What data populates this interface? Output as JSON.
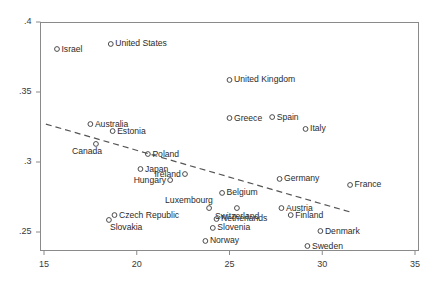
{
  "chart_data": {
    "type": "scatter",
    "title": "",
    "xlabel": "",
    "ylabel": "",
    "xlim": [
      15,
      35
    ],
    "ylim": [
      0.235,
      0.405
    ],
    "xticks": [
      15,
      20,
      25,
      30,
      35
    ],
    "xtick_labels": [
      "15",
      "20",
      "25",
      "30",
      "35"
    ],
    "yticks": [
      0.25,
      0.3,
      0.35,
      0.4
    ],
    "ytick_labels": [
      ".25",
      ".3",
      ".35",
      ".4"
    ],
    "grid": false,
    "legend": "none",
    "marker": "open-circle",
    "trendline": {
      "type": "dashed-linear-fit",
      "x_start": 15.1,
      "y_start": 0.3271,
      "x_end": 31.5,
      "y_end": 0.2643
    },
    "points": [
      {
        "label": "Israel",
        "x": 15.7,
        "y": 0.3807,
        "label_pos": "right"
      },
      {
        "label": "United States",
        "x": 18.6,
        "y": 0.3843,
        "label_pos": "right"
      },
      {
        "label": "United Kingdom",
        "x": 25.0,
        "y": 0.3586,
        "label_pos": "right"
      },
      {
        "label": "Greece",
        "x": 25.0,
        "y": 0.3314,
        "label_pos": "right"
      },
      {
        "label": "Spain",
        "x": 27.3,
        "y": 0.3321,
        "label_pos": "right"
      },
      {
        "label": "Italy",
        "x": 29.1,
        "y": 0.3236,
        "label_pos": "right"
      },
      {
        "label": "Australia",
        "x": 17.5,
        "y": 0.3271,
        "label_pos": "right"
      },
      {
        "label": "Estonia",
        "x": 18.7,
        "y": 0.3221,
        "label_pos": "right"
      },
      {
        "label": "Canada",
        "x": 17.8,
        "y": 0.3129,
        "label_pos": "below-left"
      },
      {
        "label": "Poland",
        "x": 20.6,
        "y": 0.3057,
        "label_pos": "right"
      },
      {
        "label": "Japan",
        "x": 20.2,
        "y": 0.295,
        "label_pos": "right"
      },
      {
        "label": "Ireland",
        "x": 22.6,
        "y": 0.2914,
        "label_pos": "left"
      },
      {
        "label": "Hungary",
        "x": 21.8,
        "y": 0.2871,
        "label_pos": "left"
      },
      {
        "label": "Germany",
        "x": 27.7,
        "y": 0.2879,
        "label_pos": "right"
      },
      {
        "label": "France",
        "x": 31.5,
        "y": 0.2836,
        "label_pos": "right"
      },
      {
        "label": "Belgium",
        "x": 24.6,
        "y": 0.2779,
        "label_pos": "right"
      },
      {
        "label": "Luxembourg",
        "x": 23.9,
        "y": 0.2671,
        "label_pos": "above-left"
      },
      {
        "label": "Switzerland",
        "x": 25.4,
        "y": 0.2671,
        "label_pos": "below"
      },
      {
        "label": "Austria",
        "x": 27.8,
        "y": 0.2671,
        "label_pos": "right"
      },
      {
        "label": "Finland",
        "x": 28.3,
        "y": 0.2621,
        "label_pos": "right"
      },
      {
        "label": "Czech Republic",
        "x": 18.8,
        "y": 0.2621,
        "label_pos": "right"
      },
      {
        "label": "Slovakia",
        "x": 18.5,
        "y": 0.2586,
        "label_pos": "below-right"
      },
      {
        "label": "Netherlands",
        "x": 24.3,
        "y": 0.2593,
        "label_pos": "right"
      },
      {
        "label": "Slovenia",
        "x": 24.1,
        "y": 0.2529,
        "label_pos": "right"
      },
      {
        "label": "Denmark",
        "x": 29.9,
        "y": 0.2507,
        "label_pos": "right"
      },
      {
        "label": "Norway",
        "x": 23.7,
        "y": 0.2436,
        "label_pos": "right"
      },
      {
        "label": "Sweden",
        "x": 29.2,
        "y": 0.24,
        "label_pos": "right"
      }
    ]
  }
}
